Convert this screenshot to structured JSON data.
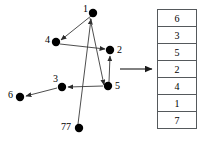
{
  "figure": {
    "graph": {
      "name": "directed-graph",
      "nodes": [
        {
          "id": "n1",
          "label": "1",
          "cx": 93,
          "cy": 13,
          "label_x": 83,
          "label_y": 4
        },
        {
          "id": "n4",
          "label": "4",
          "cx": 56,
          "cy": 42,
          "label_x": 45,
          "label_y": 35
        },
        {
          "id": "n2",
          "label": "2",
          "cx": 110,
          "cy": 50,
          "label_x": 117,
          "label_y": 46
        },
        {
          "id": "n5",
          "label": "5",
          "cx": 108,
          "cy": 86,
          "label_x": 115,
          "label_y": 81
        },
        {
          "id": "n3",
          "label": "3",
          "cx": 62,
          "cy": 87,
          "label_x": 53,
          "label_y": 74
        },
        {
          "id": "n6",
          "label": "6",
          "cx": 20,
          "cy": 97,
          "label_x": 8,
          "label_y": 90
        },
        {
          "id": "n77",
          "label": "77",
          "cx": 79,
          "cy": 128,
          "label_x": 61,
          "label_y": 121
        }
      ],
      "edges": [
        {
          "from": "1",
          "to": "4",
          "x1": 91,
          "y1": 16,
          "x2": 61,
          "y2": 40
        },
        {
          "from": "4",
          "to": "2",
          "x1": 60,
          "y1": 44,
          "x2": 105,
          "y2": 49
        },
        {
          "from": "77",
          "to": "1",
          "x1": 78,
          "y1": 124,
          "x2": 91,
          "y2": 18
        },
        {
          "from": "5",
          "to": "2",
          "x1": 109,
          "y1": 82,
          "x2": 110,
          "y2": 55
        },
        {
          "from": "5",
          "to": "3",
          "x1": 103,
          "y1": 86,
          "x2": 67,
          "y2": 87
        },
        {
          "from": "3",
          "to": "6",
          "x1": 57,
          "y1": 88,
          "x2": 25,
          "y2": 96
        },
        {
          "from": "1",
          "to": "5",
          "x1": 90,
          "y1": 17,
          "x2": 104,
          "y2": 85
        }
      ]
    },
    "transform_arrow": {
      "name": "transform-arrow",
      "x1": 120,
      "y1": 69,
      "x2": 151,
      "y2": 69
    },
    "table": {
      "name": "topological-order-table",
      "cells": [
        "6",
        "3",
        "5",
        "2",
        "4",
        "1",
        "7"
      ]
    },
    "colors": {
      "node_fill": "#000000",
      "edge_stroke": "#3a3a3a",
      "table_border": "#55595c",
      "text": "#000000",
      "background": "#ffffff"
    }
  }
}
